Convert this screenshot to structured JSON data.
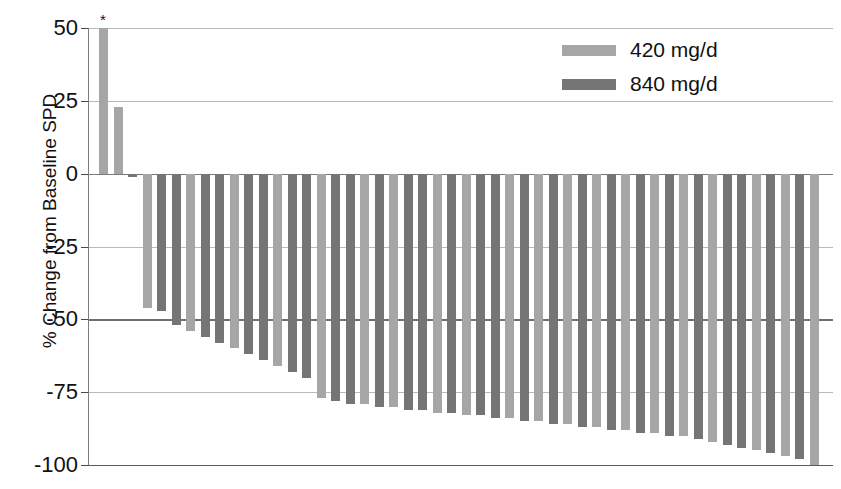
{
  "chart_data": {
    "type": "bar",
    "title": "",
    "subtitle": "",
    "xlabel": "",
    "ylabel": "% Change from Baseline SPD",
    "ylim": [
      -100,
      50
    ],
    "yticks": [
      50,
      25,
      0,
      -25,
      -50,
      -75,
      -100
    ],
    "ytick_labels": [
      "50",
      "25",
      "0",
      "-25",
      "-50",
      "-75",
      "-100"
    ],
    "grid": true,
    "grid_axis": "y",
    "reference_lines": [
      {
        "value": -50,
        "style": "bold"
      },
      {
        "value": 0,
        "style": "axis"
      }
    ],
    "legend_position": "top-right",
    "annotations": [
      {
        "text": "*",
        "bar_index": 0,
        "note": "asterisk above first bar"
      }
    ],
    "series": [
      {
        "name": "420 mg/d",
        "color": "#a6a6a6"
      },
      {
        "name": "840 mg/d",
        "color": "#757575"
      }
    ],
    "bars": [
      {
        "index": 0,
        "value": 50,
        "group": "420 mg/d",
        "annotation": "*"
      },
      {
        "index": 1,
        "value": 23,
        "group": "420 mg/d"
      },
      {
        "index": 2,
        "value": -1,
        "group": "840 mg/d"
      },
      {
        "index": 3,
        "value": -46,
        "group": "420 mg/d"
      },
      {
        "index": 4,
        "value": -47,
        "group": "840 mg/d"
      },
      {
        "index": 5,
        "value": -52,
        "group": "840 mg/d"
      },
      {
        "index": 6,
        "value": -54,
        "group": "420 mg/d"
      },
      {
        "index": 7,
        "value": -56,
        "group": "840 mg/d"
      },
      {
        "index": 8,
        "value": -58,
        "group": "840 mg/d"
      },
      {
        "index": 9,
        "value": -60,
        "group": "420 mg/d"
      },
      {
        "index": 10,
        "value": -62,
        "group": "840 mg/d"
      },
      {
        "index": 11,
        "value": -64,
        "group": "840 mg/d"
      },
      {
        "index": 12,
        "value": -66,
        "group": "420 mg/d"
      },
      {
        "index": 13,
        "value": -68,
        "group": "840 mg/d"
      },
      {
        "index": 14,
        "value": -70,
        "group": "840 mg/d"
      },
      {
        "index": 15,
        "value": -77,
        "group": "420 mg/d"
      },
      {
        "index": 16,
        "value": -78,
        "group": "840 mg/d"
      },
      {
        "index": 17,
        "value": -79,
        "group": "840 mg/d"
      },
      {
        "index": 18,
        "value": -79,
        "group": "420 mg/d"
      },
      {
        "index": 19,
        "value": -80,
        "group": "840 mg/d"
      },
      {
        "index": 20,
        "value": -80,
        "group": "420 mg/d"
      },
      {
        "index": 21,
        "value": -81,
        "group": "840 mg/d"
      },
      {
        "index": 22,
        "value": -81,
        "group": "840 mg/d"
      },
      {
        "index": 23,
        "value": -82,
        "group": "420 mg/d"
      },
      {
        "index": 24,
        "value": -82,
        "group": "840 mg/d"
      },
      {
        "index": 25,
        "value": -83,
        "group": "420 mg/d"
      },
      {
        "index": 26,
        "value": -83,
        "group": "840 mg/d"
      },
      {
        "index": 27,
        "value": -84,
        "group": "840 mg/d"
      },
      {
        "index": 28,
        "value": -84,
        "group": "420 mg/d"
      },
      {
        "index": 29,
        "value": -85,
        "group": "840 mg/d"
      },
      {
        "index": 30,
        "value": -85,
        "group": "420 mg/d"
      },
      {
        "index": 31,
        "value": -86,
        "group": "840 mg/d"
      },
      {
        "index": 32,
        "value": -86,
        "group": "420 mg/d"
      },
      {
        "index": 33,
        "value": -87,
        "group": "840 mg/d"
      },
      {
        "index": 34,
        "value": -87,
        "group": "420 mg/d"
      },
      {
        "index": 35,
        "value": -88,
        "group": "840 mg/d"
      },
      {
        "index": 36,
        "value": -88,
        "group": "420 mg/d"
      },
      {
        "index": 37,
        "value": -89,
        "group": "840 mg/d"
      },
      {
        "index": 38,
        "value": -89,
        "group": "420 mg/d"
      },
      {
        "index": 39,
        "value": -90,
        "group": "840 mg/d"
      },
      {
        "index": 40,
        "value": -90,
        "group": "420 mg/d"
      },
      {
        "index": 41,
        "value": -91,
        "group": "840 mg/d"
      },
      {
        "index": 42,
        "value": -92,
        "group": "420 mg/d"
      },
      {
        "index": 43,
        "value": -93,
        "group": "840 mg/d"
      },
      {
        "index": 44,
        "value": -94,
        "group": "840 mg/d"
      },
      {
        "index": 45,
        "value": -95,
        "group": "420 mg/d"
      },
      {
        "index": 46,
        "value": -96,
        "group": "840 mg/d"
      },
      {
        "index": 47,
        "value": -97,
        "group": "420 mg/d"
      },
      {
        "index": 48,
        "value": -98,
        "group": "840 mg/d"
      },
      {
        "index": 49,
        "value": -100,
        "group": "420 mg/d"
      }
    ]
  },
  "legend": {
    "items": [
      {
        "label": "420 mg/d",
        "color": "#a6a6a6",
        "swatch": "bar-swatch"
      },
      {
        "label": "840 mg/d",
        "color": "#757575",
        "swatch": "bar-swatch"
      }
    ]
  },
  "axis": {
    "y_title": "% Change from Baseline SPD"
  }
}
